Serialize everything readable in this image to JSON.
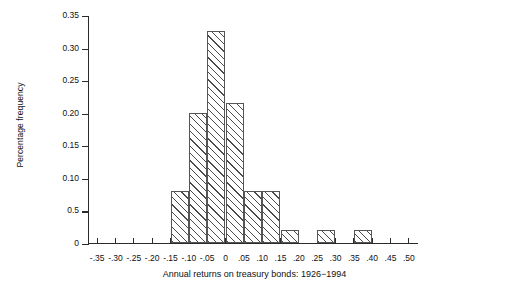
{
  "chart_data": {
    "type": "bar",
    "title": "",
    "caption": "Annual returns on treasury bonds: 1926−1994",
    "xlabel": "Annual returns on treasury bonds: 1926−1994",
    "ylabel": "Percentage frequency",
    "xlim": [
      -0.375,
      0.525
    ],
    "ylim": [
      0,
      0.35
    ],
    "grid": false,
    "legend": null,
    "x_tick_labels": [
      "-.35",
      "-.30",
      "-.25",
      "-.20",
      "-.15",
      "-.10",
      "-.05",
      "0",
      ".05",
      ".10",
      ".15",
      ".20",
      ".25",
      ".30",
      ".35",
      ".40",
      ".45",
      ".50"
    ],
    "x_tick_values": [
      -0.35,
      -0.3,
      -0.25,
      -0.2,
      -0.15,
      -0.1,
      -0.05,
      0,
      0.05,
      0.1,
      0.15,
      0.2,
      0.25,
      0.3,
      0.35,
      0.4,
      0.45,
      0.5
    ],
    "y_tick_labels": [
      "0",
      "0.5",
      "0.10",
      "0.15",
      "0.20",
      "0.25",
      "0.30",
      "0.35"
    ],
    "y_tick_values": [
      0,
      0.05,
      0.1,
      0.15,
      0.2,
      0.25,
      0.3,
      0.35
    ],
    "bin_width": 0.05,
    "categories": [
      "-.35 to -.30",
      "-.30 to -.25",
      "-.25 to -.20",
      "-.20 to -.15",
      "-.15 to -.10",
      "-.10 to -.05",
      "-.05 to 0",
      "0 to .05",
      ".05 to .10",
      ".10 to .15",
      ".15 to .20",
      ".20 to .25",
      ".25 to .30",
      ".30 to .35",
      ".35 to .40",
      ".40 to .45",
      ".45 to .50"
    ],
    "bins": [
      {
        "left": -0.35,
        "right": -0.3,
        "value": 0
      },
      {
        "left": -0.3,
        "right": -0.25,
        "value": 0
      },
      {
        "left": -0.25,
        "right": -0.2,
        "value": 0
      },
      {
        "left": -0.2,
        "right": -0.15,
        "value": 0
      },
      {
        "left": -0.15,
        "right": -0.1,
        "value": 0.08
      },
      {
        "left": -0.1,
        "right": -0.05,
        "value": 0.2
      },
      {
        "left": -0.05,
        "right": 0.0,
        "value": 0.325
      },
      {
        "left": 0.0,
        "right": 0.05,
        "value": 0.215
      },
      {
        "left": 0.05,
        "right": 0.1,
        "value": 0.08
      },
      {
        "left": 0.1,
        "right": 0.15,
        "value": 0.08
      },
      {
        "left": 0.15,
        "right": 0.2,
        "value": 0.02
      },
      {
        "left": 0.2,
        "right": 0.25,
        "value": 0
      },
      {
        "left": 0.25,
        "right": 0.3,
        "value": 0.02
      },
      {
        "left": 0.3,
        "right": 0.35,
        "value": 0
      },
      {
        "left": 0.35,
        "right": 0.4,
        "value": 0.02
      },
      {
        "left": 0.4,
        "right": 0.45,
        "value": 0
      },
      {
        "left": 0.45,
        "right": 0.5,
        "value": 0
      }
    ],
    "values": [
      0,
      0,
      0,
      0,
      0.08,
      0.2,
      0.325,
      0.215,
      0.08,
      0.08,
      0.02,
      0,
      0.02,
      0,
      0.02,
      0,
      0
    ]
  }
}
